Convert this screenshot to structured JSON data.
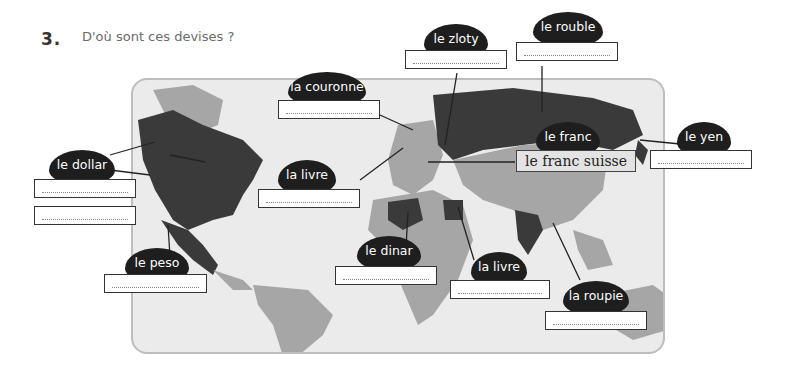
{
  "exercise": {
    "number": "3.",
    "title": "D'où sont ces devises ?"
  },
  "labels": {
    "dollar": "le dollar",
    "peso": "le peso",
    "couronne": "la couronne",
    "livre_uk": "la livre",
    "zloty": "le zloty",
    "rouble": "le rouble",
    "franc": "le franc",
    "yen": "le yen",
    "dinar": "le dinar",
    "livre_egypt": "la livre",
    "roupie": "la roupie"
  },
  "given_answer": {
    "franc": "le franc suisse"
  },
  "colors": {
    "bubble": "#1e1e1e",
    "map_bg": "#ebebeb",
    "land_light": "#a6a6a6",
    "land_dark": "#3a3a3a",
    "answer_fill": "#e3e3e3"
  }
}
